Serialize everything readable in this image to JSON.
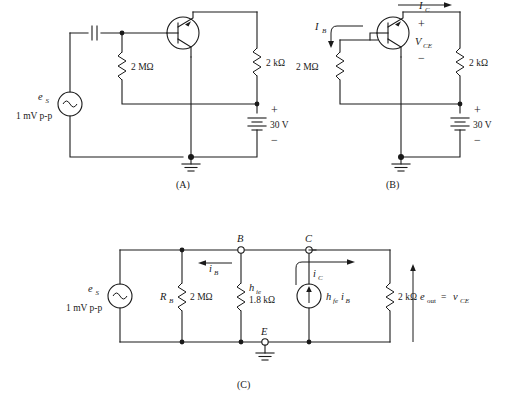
{
  "figure": {
    "background_color": "#ffffff",
    "line_color": "#1a1a1a"
  },
  "panels": [
    {
      "id": "A",
      "caption": "(A)",
      "labels": {
        "source_symbol": "e",
        "source_sub": "S",
        "source_value": "1 mV p-p",
        "base_resistor": "2 MΩ",
        "collector_resistor": "2 kΩ",
        "battery_value": "30 V",
        "battery_plus": "+",
        "battery_minus": "−"
      },
      "components": [
        "ac-source",
        "coupling-capacitor",
        "base-resistor-2-megohm",
        "npn-transistor",
        "collector-resistor-2-kilohm",
        "battery-30v",
        "ground"
      ]
    },
    {
      "id": "B",
      "caption": "(B)",
      "labels": {
        "base_current": "I",
        "base_current_sub": "B",
        "collector_current": "I",
        "collector_current_sub": "C",
        "vce": "V",
        "vce_sub": "CE",
        "vce_plus": "+",
        "vce_minus": "−",
        "base_resistor": "2 MΩ",
        "collector_resistor": "2 kΩ",
        "battery_value": "30 V",
        "battery_plus": "+",
        "battery_minus": "−"
      },
      "components": [
        "base-resistor-2-megohm",
        "npn-transistor",
        "collector-resistor-2-kilohm",
        "battery-30v",
        "ground",
        "ib-arrow",
        "ic-arrow",
        "vce-polarity"
      ]
    },
    {
      "id": "C",
      "caption": "(C)",
      "labels": {
        "source_symbol": "e",
        "source_sub": "S",
        "source_value": "1 mV p-p",
        "rb_symbol": "R",
        "rb_sub": "B",
        "rb_value": "2 MΩ",
        "hie_symbol": "h",
        "hie_sub": "ie",
        "hie_value": "1.8 kΩ",
        "ib_symbol": "i",
        "ib_sub": "B",
        "ic_symbol": "i",
        "ic_sub": "C",
        "current_source_symbol": "h",
        "current_source_sub1": "fe",
        "current_source_mid": "i",
        "current_source_sub2": "B",
        "load_resistor": "2 kΩ",
        "output_symbol": "e",
        "output_sub": "out",
        "output_equals": "=",
        "output_v": "v",
        "output_v_sub": "CE",
        "node_b": "B",
        "node_c": "C",
        "node_e": "E"
      },
      "components": [
        "ac-source",
        "rb-resistor",
        "hie-resistor",
        "dependent-current-source",
        "load-resistor-2-kilohm",
        "ground",
        "terminal-b",
        "terminal-c",
        "terminal-e",
        "ib-arrow",
        "ic-arrow",
        "eout-arrow"
      ]
    }
  ]
}
